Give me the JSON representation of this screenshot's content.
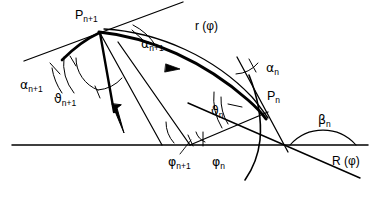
{
  "figure": {
    "background_color": "#ffffff",
    "stroke_color": "#000000",
    "width": 384,
    "height": 200
  },
  "labels": {
    "p_next": {
      "base": "P",
      "sub": "n+1",
      "x": 75,
      "y": 9
    },
    "p_n": {
      "base": "P",
      "sub": "n",
      "x": 267,
      "y": 90
    },
    "r_phi": {
      "text": "r (φ)",
      "x": 195,
      "y": 20
    },
    "R_phi": {
      "text": "R (φ)",
      "x": 332,
      "y": 155
    },
    "alpha_next_top": {
      "base": "α",
      "sub": "n+1",
      "x": 141,
      "y": 38
    },
    "alpha_next_left": {
      "base": "α",
      "sub": "n+1",
      "x": 20,
      "y": 79
    },
    "alpha_n": {
      "base": "α",
      "sub": "n",
      "x": 266,
      "y": 62
    },
    "theta_next": {
      "base": "ϑ",
      "sub": "n+1",
      "x": 54,
      "y": 93
    },
    "theta_n": {
      "base": "ϑ",
      "sub": "n",
      "x": 211,
      "y": 105
    },
    "phi_next": {
      "base": "φ",
      "sub": "n+1",
      "x": 168,
      "y": 156
    },
    "phi_n": {
      "base": "φ",
      "sub": "n",
      "x": 212,
      "y": 156
    },
    "beta_n": {
      "base": "β",
      "sub": "n",
      "x": 318,
      "y": 114
    }
  },
  "geometry": {
    "baseline_y": 145,
    "baseline_x_start": 12,
    "baseline_x_end": 368,
    "vertex_p_next": {
      "x": 100,
      "y": 32
    },
    "vertex_p_n": {
      "x": 264,
      "y": 117
    },
    "origin_phi": {
      "x": 190,
      "y": 145
    },
    "origin_beta": {
      "x": 295,
      "y": 145
    }
  },
  "colors": {
    "ink": "#000000",
    "paper": "#ffffff"
  }
}
